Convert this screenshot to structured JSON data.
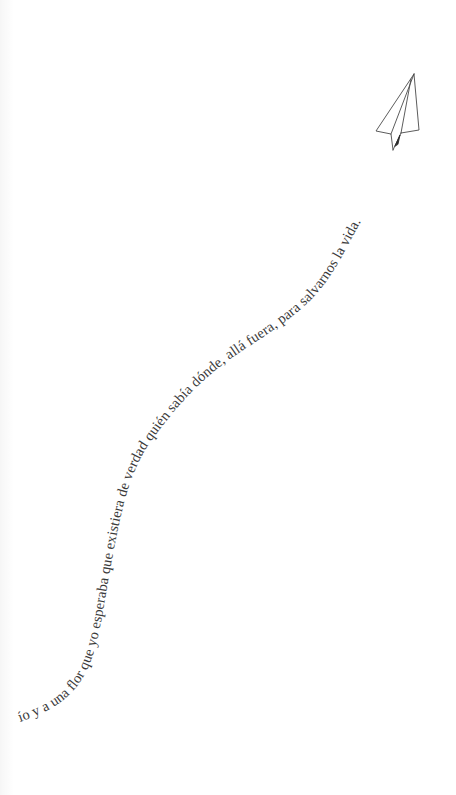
{
  "page": {
    "background": "#ffffff",
    "text_color": "#3a3a3a"
  },
  "curved_text": {
    "content": "ío y a una flor que yo esperaba que existiera de verdad quién sabía dónde, allá fuera, para salvarnos la vida."
  },
  "illustration": {
    "icon": "paper-plane-icon"
  }
}
